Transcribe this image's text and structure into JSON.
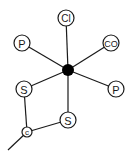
{
  "diagram": {
    "type": "coordination-complex",
    "center": {
      "label": "metal-center",
      "x": 68,
      "y": 70,
      "r": 6
    },
    "atoms": [
      {
        "id": "cl",
        "label": "Cl",
        "x": 66,
        "y": 18,
        "r": 8,
        "font_size": 10
      },
      {
        "id": "p1",
        "label": "P",
        "x": 22,
        "y": 43,
        "r": 8,
        "font_size": 11
      },
      {
        "id": "co",
        "label": "CO",
        "x": 111,
        "y": 43,
        "r": 8,
        "font_size": 9
      },
      {
        "id": "p2",
        "label": "P",
        "x": 116,
        "y": 89,
        "r": 8,
        "font_size": 11
      },
      {
        "id": "s1",
        "label": "S",
        "x": 24,
        "y": 89,
        "r": 8,
        "font_size": 11
      },
      {
        "id": "s2",
        "label": "S",
        "x": 68,
        "y": 120,
        "r": 8,
        "font_size": 11
      },
      {
        "id": "c",
        "label": "c",
        "x": 27,
        "y": 132,
        "r": 5,
        "font_size": 8
      }
    ],
    "bonds": [
      [
        "center",
        "cl"
      ],
      [
        "center",
        "p1"
      ],
      [
        "center",
        "co"
      ],
      [
        "center",
        "p2"
      ],
      [
        "center",
        "s1"
      ],
      [
        "center",
        "s2"
      ],
      [
        "s1",
        "c"
      ],
      [
        "s2",
        "c"
      ]
    ],
    "tail": {
      "from": "c",
      "x2": 8,
      "y2": 150
    },
    "colors": {
      "line": "#1a1a1a",
      "center": "#000000",
      "background": "#ffffff"
    }
  }
}
